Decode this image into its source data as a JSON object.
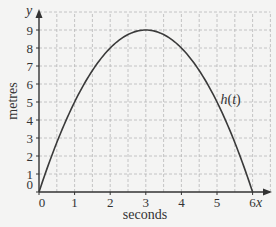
{
  "chart_data": {
    "type": "line",
    "title": "",
    "xlabel": "seconds",
    "ylabel": "metres",
    "x_axis_symbol": "x",
    "y_axis_symbol": "y",
    "xlim": [
      0,
      6.5
    ],
    "ylim": [
      0,
      10
    ],
    "x_ticks": [
      "0",
      "1",
      "2",
      "3",
      "4",
      "5",
      "6"
    ],
    "y_ticks": [
      "0",
      "1",
      "2",
      "3",
      "4",
      "5",
      "6",
      "7",
      "8",
      "9"
    ],
    "grid": true,
    "grid_step": {
      "x": 0.5,
      "y": 1
    },
    "series": [
      {
        "name": "h(t)",
        "label": "h(t)",
        "x": [
          0,
          0.5,
          1,
          1.5,
          2,
          2.5,
          3,
          3.5,
          4,
          4.5,
          5,
          5.5,
          6
        ],
        "values": [
          0,
          2.75,
          5,
          6.75,
          8,
          8.75,
          9,
          8.75,
          8,
          6.75,
          5,
          2.75,
          0
        ]
      }
    ],
    "annotations": [
      {
        "text": "h(t)",
        "x": 5.1,
        "y": 4.9
      }
    ],
    "colors": {
      "curve": "#3a3a3a",
      "grid": "#b8b8b8",
      "axis": "#333333",
      "background": "#f4f4f3"
    }
  }
}
